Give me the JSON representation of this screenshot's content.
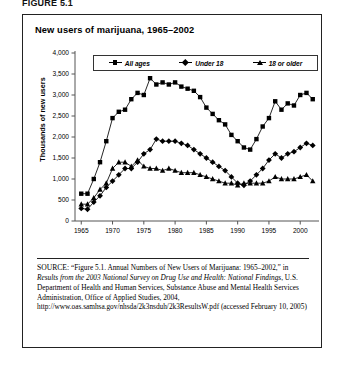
{
  "figure_label": "FIGURE 5.1",
  "chart_title": "New users of marijuana, 1965–2002",
  "axes": {
    "ylabel": "Thousands of new users",
    "yticks": [
      "0",
      "500",
      "1,000",
      "1,500",
      "2,000",
      "2,500",
      "3,000",
      "3,500",
      "4,000"
    ],
    "xticks": [
      "1965",
      "1970",
      "1975",
      "1980",
      "1985",
      "1990",
      "1995",
      "2000"
    ]
  },
  "legend": [
    {
      "label": "All ages",
      "marker": "square-marker"
    },
    {
      "label": "Under 18",
      "marker": "diamond-marker"
    },
    {
      "label": "18 or older",
      "marker": "triangle-marker"
    }
  ],
  "source": {
    "prefix": "SOURCE:",
    "part1": " “Figure 5.1. Annual Numbers of New Users of Marijuana: 1965–2002,” in ",
    "italic1": "Results from the 2003 National Survey on Drug Use and Health: National Findings",
    "part2": ", U.S. Department of Health and Human Services, Substance Abuse and Mental Health Services Administration, Office of Applied Studies, 2004, http://www.oas.samhsa.gov/nhsda/2k3nsduh/2k3ResultsW.pdf (accessed February 10, 2005)"
  },
  "chart_data": {
    "type": "line",
    "title": "New users of marijuana, 1965–2002",
    "xlabel": "",
    "ylabel": "Thousands of new users",
    "xlim": [
      1964,
      2003
    ],
    "ylim": [
      0,
      4000
    ],
    "grid": false,
    "legend_position": "top",
    "x": [
      1965,
      1966,
      1967,
      1968,
      1969,
      1970,
      1971,
      1972,
      1973,
      1974,
      1975,
      1976,
      1977,
      1978,
      1979,
      1980,
      1981,
      1982,
      1983,
      1984,
      1985,
      1986,
      1987,
      1988,
      1989,
      1990,
      1991,
      1992,
      1993,
      1994,
      1995,
      1996,
      1997,
      1998,
      1999,
      2000,
      2001,
      2002
    ],
    "series": [
      {
        "name": "All ages",
        "marker": "square",
        "values": [
          650,
          650,
          1000,
          1400,
          1900,
          2450,
          2600,
          2650,
          2900,
          3050,
          3000,
          3400,
          3250,
          3300,
          3250,
          3300,
          3200,
          3150,
          3100,
          2950,
          2700,
          2550,
          2400,
          2300,
          2050,
          1900,
          1750,
          1700,
          1950,
          2250,
          2450,
          2850,
          2650,
          2800,
          2750,
          3000,
          3050,
          2900
        ]
      },
      {
        "name": "Under 18",
        "marker": "diamond",
        "values": [
          300,
          280,
          450,
          600,
          800,
          950,
          1100,
          1250,
          1250,
          1400,
          1600,
          1700,
          1950,
          1900,
          1900,
          1900,
          1850,
          1800,
          1700,
          1600,
          1500,
          1400,
          1300,
          1200,
          1050,
          900,
          850,
          950,
          1100,
          1250,
          1450,
          1600,
          1500,
          1600,
          1650,
          1750,
          1850,
          1800
        ]
      },
      {
        "name": "18 or older",
        "marker": "triangle",
        "values": [
          400,
          400,
          550,
          750,
          900,
          1250,
          1400,
          1400,
          1300,
          1450,
          1300,
          1250,
          1250,
          1200,
          1250,
          1200,
          1150,
          1150,
          1150,
          1100,
          1050,
          1000,
          950,
          900,
          900,
          850,
          900,
          900,
          900,
          900,
          950,
          1050,
          1000,
          1000,
          1000,
          1050,
          1100,
          950
        ]
      }
    ]
  }
}
